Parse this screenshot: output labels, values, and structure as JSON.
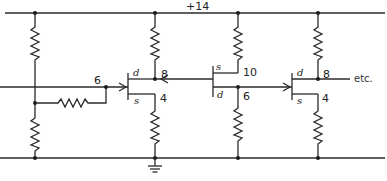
{
  "diagram": {
    "type": "circuit-schematic",
    "supply_label": "+14",
    "continuation_label": "etc.",
    "ground": "ground-symbol",
    "nodes": {
      "input_gate_t1": "6",
      "t1_drain": "8",
      "t1_source": "4",
      "t2_source": "10",
      "t2_drain": "6",
      "t3_drain": "8",
      "t3_source": "4"
    },
    "transistors": [
      {
        "id": "T1",
        "drain": "d",
        "source": "s"
      },
      {
        "id": "T2",
        "drain": "d",
        "source": "s"
      },
      {
        "id": "T3",
        "drain": "d",
        "source": "s"
      }
    ]
  }
}
